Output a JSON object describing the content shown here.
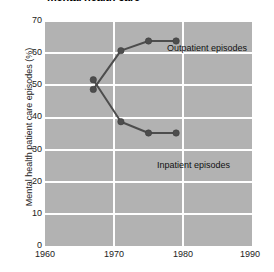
{
  "chart_data": {
    "type": "line",
    "title": "mental health care",
    "xlabel": "",
    "ylabel": "Mental health  patient care episodes (%)",
    "xlim": [
      1960,
      1990
    ],
    "ylim": [
      0,
      70
    ],
    "xticks": [
      1960,
      1970,
      1980,
      1990
    ],
    "yticks": [
      0,
      10,
      20,
      30,
      40,
      50,
      60,
      70
    ],
    "grid": true,
    "legend_position": "inline-annotations",
    "panel_color": "#b2b2b2",
    "grid_color": "#ffffff",
    "series_color": "#4d4d4d",
    "series": [
      {
        "name": "Outpatient episodes",
        "x": [
          1967,
          1971,
          1975,
          1979
        ],
        "values": [
          48.5,
          60.5,
          63.5,
          63.5
        ],
        "annotation": "Outpatient episodes"
      },
      {
        "name": "Inpatient episodes",
        "x": [
          1967,
          1971,
          1975,
          1979
        ],
        "values": [
          51.5,
          38.5,
          35.0,
          35.0
        ],
        "annotation": "Inpatient episodes"
      }
    ]
  },
  "axis": {
    "y_tick_labels": [
      "70",
      "60",
      "50",
      "40",
      "30",
      "20",
      "10",
      "0"
    ],
    "x_tick_labels": [
      "1960",
      "1970",
      "1980",
      "1990"
    ]
  }
}
